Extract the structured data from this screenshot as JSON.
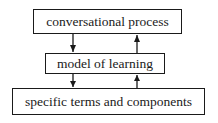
{
  "diagram": {
    "boxes": [
      {
        "id": "top",
        "label": "conversational process"
      },
      {
        "id": "middle",
        "label": "model of learning"
      },
      {
        "id": "bottom",
        "label": "specific terms and components"
      }
    ],
    "arrows": [
      {
        "from": "conversational process",
        "to": "model of learning",
        "direction": "down"
      },
      {
        "from": "model of learning",
        "to": "conversational process",
        "direction": "up"
      },
      {
        "from": "model of learning",
        "to": "specific terms and components",
        "direction": "down"
      },
      {
        "from": "specific terms and components",
        "to": "model of learning",
        "direction": "up"
      }
    ],
    "colors": {
      "stroke": "#1a1a1a",
      "background": "#ffffff"
    }
  }
}
